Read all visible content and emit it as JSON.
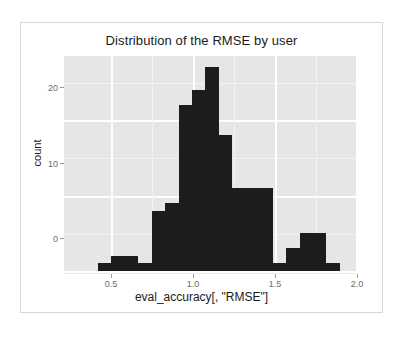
{
  "chart_data": {
    "type": "bar",
    "title": "Distribution of the RMSE by user",
    "xlabel": "eval_accuracy[, \"RMSE\"]",
    "ylabel": "count",
    "xlim": [
      0.33,
      1.95
    ],
    "ylim": [
      0,
      28
    ],
    "xticks": [
      "0.5",
      "1.0",
      "1.5",
      "2.0"
    ],
    "xtick_values": [
      0.5,
      1.0,
      1.5,
      2.0
    ],
    "yticks": [
      "0",
      "10",
      "20"
    ],
    "ytick_values": [
      0,
      10,
      20
    ],
    "grid": true,
    "legend": "none",
    "panel_background": "#e6e6e6",
    "bar_color": "#1c1c1c",
    "bin_width": 0.082,
    "bin_starts": [
      0.42,
      0.502,
      0.584,
      0.666,
      0.748,
      0.83,
      0.912,
      0.994,
      1.076,
      1.158,
      1.24,
      1.322,
      1.404,
      1.486,
      1.568,
      1.65,
      1.732,
      1.814
    ],
    "bin_centers": [
      0.461,
      0.543,
      0.625,
      0.707,
      0.789,
      0.871,
      0.953,
      1.035,
      1.117,
      1.199,
      1.281,
      1.363,
      1.445,
      1.527,
      1.609,
      1.691,
      1.773,
      1.855
    ],
    "categories": [
      "0.46",
      "0.54",
      "0.62",
      "0.71",
      "0.79",
      "0.87",
      "0.95",
      "1.04",
      "1.12",
      "1.20",
      "1.28",
      "1.36",
      "1.45",
      "1.53",
      "1.61",
      "1.69",
      "1.77",
      "1.86"
    ],
    "values": [
      1,
      2,
      2,
      1,
      8,
      9,
      22,
      24,
      27,
      18,
      11,
      11,
      11,
      1,
      3,
      5,
      5,
      1
    ]
  },
  "chart": {
    "title": "Distribution of the RMSE by user",
    "x_axis_title": "eval_accuracy[, \"RMSE\"]",
    "y_axis_title": "count",
    "x_tick_labels": [
      "0.5",
      "1.0",
      "1.5",
      "2.0"
    ],
    "y_tick_labels": [
      "20",
      "10",
      "0"
    ]
  }
}
